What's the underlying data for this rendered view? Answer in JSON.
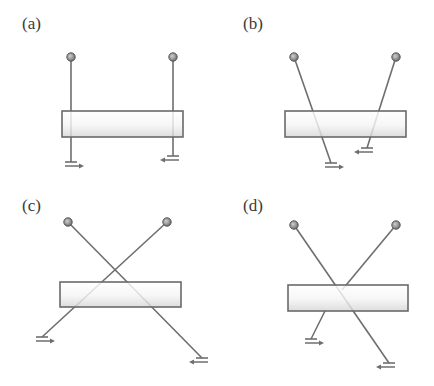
{
  "figure": {
    "panels": [
      {
        "label": "(a)",
        "label_pos": [
          22,
          14
        ],
        "bar": {
          "x": 62,
          "y": 111,
          "w": 121,
          "h": 26
        },
        "wires": [
          {
            "bulb": [
              71,
              57
            ],
            "end": [
              71,
              162
            ],
            "ground_dir": "right"
          },
          {
            "bulb": [
              173,
              57
            ],
            "end": [
              173,
              156
            ],
            "ground_dir": "left"
          }
        ]
      },
      {
        "label": "(b)",
        "label_pos": [
          243,
          14
        ],
        "bar": {
          "x": 285,
          "y": 111,
          "w": 121,
          "h": 26
        },
        "wires": [
          {
            "bulb": [
              294,
              57
            ],
            "end": [
              331,
              163
            ],
            "ground_dir": "right"
          },
          {
            "bulb": [
              396,
              57
            ],
            "end": [
              367,
              148
            ],
            "ground_dir": "left"
          }
        ]
      },
      {
        "label": "(c)",
        "label_pos": [
          22,
          196
        ],
        "bar": {
          "x": 60,
          "y": 282,
          "w": 121,
          "h": 25
        },
        "wires": [
          {
            "bulb": [
              68,
              222
            ],
            "end": [
              202,
              358
            ],
            "ground_dir": "left"
          },
          {
            "bulb": [
              167,
              222
            ],
            "end": [
              42,
              337
            ],
            "ground_dir": "right"
          }
        ]
      },
      {
        "label": "(d)",
        "label_pos": [
          243,
          196
        ],
        "bar": {
          "x": 288,
          "y": 285,
          "w": 120,
          "h": 26
        },
        "wires": [
          {
            "bulb": [
              294,
              225
            ],
            "end": [
              389,
              363
            ],
            "ground_dir": "left"
          },
          {
            "bulb": [
              396,
              225
            ],
            "end": [
              342,
              290
            ],
            "ground_dir": "none"
          },
          {
            "bulb": [
              325,
              311
            ],
            "end": [
              311,
              339
            ],
            "ground_dir": "right",
            "no_bulb": true
          }
        ]
      }
    ]
  },
  "colors": {
    "line": "#6e6e6e",
    "bar_stroke": "#6a6a6a",
    "bar_fill_top": "#ffffff",
    "bar_fill_bottom": "#d8d8d8",
    "bulb_fill": "#9a9a9a",
    "bulb_stroke": "#555555",
    "label": "#3a3a3a"
  }
}
